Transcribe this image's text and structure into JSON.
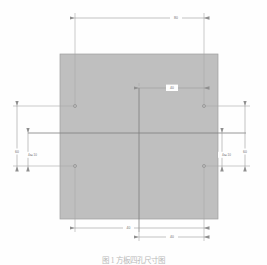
{
  "drawing": {
    "title": "square-plate-with-four-holes",
    "plate": {
      "name": "plate-body",
      "fill": "#bfbfbf",
      "stroke": "#8a8a8a",
      "x": 60,
      "y": 54,
      "width": 158,
      "height": 165
    },
    "colors": {
      "dimension_line": "#9a9a9a",
      "extension_line": "#a8a8a8",
      "center_line": "#7a7a7a",
      "text": "#6d6d6d",
      "background": "#fefefe"
    },
    "centerlines": {
      "vertical_x": 139,
      "horizontal_y": 133
    },
    "holes": [
      {
        "name": "hole-top-left",
        "cx": 75,
        "cy": 106
      },
      {
        "name": "hole-top-right",
        "cx": 204,
        "cy": 106
      },
      {
        "name": "hole-bottom-left",
        "cx": 75,
        "cy": 166
      },
      {
        "name": "hole-bottom-right",
        "cx": 204,
        "cy": 166
      }
    ],
    "dimensions": [
      {
        "name": "dim-top-hole-spacing",
        "label": "80",
        "orientation": "horizontal",
        "x1": 75,
        "x2": 204,
        "y": 18,
        "text_x": 176,
        "text_y": 18
      },
      {
        "name": "dim-center-to-right-hole",
        "label": "40",
        "orientation": "horizontal",
        "x1": 139,
        "x2": 204,
        "y": 88,
        "text_x": 172,
        "text_y": 88
      },
      {
        "name": "dim-bottom-left-span",
        "label": "40",
        "orientation": "horizontal",
        "x1": 75,
        "x2": 139,
        "y": 228,
        "text_x": 128,
        "text_y": 228
      },
      {
        "name": "dim-bottom-right-span",
        "label": "40",
        "orientation": "horizontal",
        "x1": 139,
        "x2": 204,
        "y": 237,
        "text_x": 172,
        "text_y": 237
      },
      {
        "name": "dim-left-overall-height",
        "label": "60",
        "orientation": "vertical",
        "y1": 106,
        "y2": 166,
        "x": 17,
        "text_x": 17,
        "text_y": 152
      },
      {
        "name": "dim-left-hole-callout",
        "label": "4x⌀10",
        "orientation": "vertical",
        "y1": 133,
        "y2": 166,
        "x": 28,
        "text_x": 31,
        "text_y": 155
      },
      {
        "name": "dim-right-overall-height",
        "label": "60",
        "orientation": "vertical",
        "y1": 106,
        "y2": 166,
        "x": 245,
        "text_x": 245,
        "text_y": 152
      },
      {
        "name": "dim-right-hole-callout",
        "label": "4x⌀10",
        "orientation": "vertical",
        "y1": 133,
        "y2": 166,
        "x": 222,
        "text_x": 225,
        "text_y": 155
      }
    ],
    "caption": "图 1    方板四孔尺寸图"
  }
}
